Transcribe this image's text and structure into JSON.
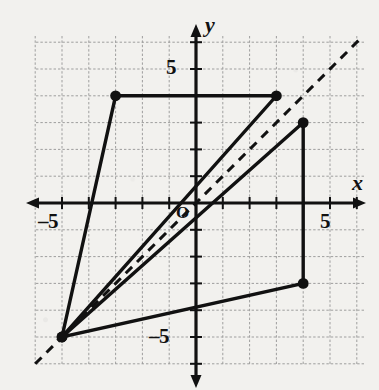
{
  "chart_data": {
    "type": "scatter",
    "title": "",
    "xlabel": "x",
    "ylabel": "y",
    "grid": true,
    "legend": "none",
    "xlim": [
      -6,
      6.3
    ],
    "ylim": [
      -6.1,
      6.2
    ],
    "xticks": [
      -5,
      5
    ],
    "yticks": [
      -5,
      5
    ],
    "xtick_labels": [
      "–5",
      "5"
    ],
    "ytick_labels": [
      "–5",
      "5"
    ],
    "origin_label": "O",
    "annotations": [
      {
        "text": "y",
        "role": "y-axis-label"
      },
      {
        "text": "x",
        "role": "x-axis-label"
      },
      {
        "text": "O",
        "role": "origin-label"
      }
    ],
    "series": [
      {
        "name": "preimage-triangle",
        "type": "closed-polygon",
        "style": "solid",
        "points": [
          [
            -3,
            4
          ],
          [
            3,
            4
          ],
          [
            -5,
            -5
          ]
        ],
        "vertices_marked": [
          [
            -3,
            4
          ],
          [
            3,
            4
          ],
          [
            -5,
            -5
          ]
        ]
      },
      {
        "name": "image-triangle",
        "type": "closed-polygon",
        "style": "solid",
        "points": [
          [
            4,
            3
          ],
          [
            4,
            -3
          ],
          [
            -5,
            -5
          ]
        ],
        "vertices_marked": [
          [
            4,
            3
          ],
          [
            4,
            -3
          ],
          [
            -5,
            -5
          ]
        ]
      },
      {
        "name": "line-of-reflection",
        "type": "line",
        "style": "dashed",
        "equation": "y = x",
        "points": [
          [
            -6,
            -6
          ],
          [
            6.1,
            6.1
          ]
        ]
      }
    ]
  },
  "geometry": {
    "origin_px": {
      "x": 196,
      "y": 203
    },
    "unit_px": 26.8,
    "grid_bounds_px": {
      "left": 36,
      "top": 36,
      "right": 366,
      "bottom": 366
    }
  },
  "labels": {
    "y_axis": "y",
    "x_axis": "x",
    "origin": "O",
    "y_five": "5",
    "y_neg_five": "–5",
    "x_five": "5",
    "x_neg_five": "–5"
  },
  "colors": {
    "background": "#f2f1ee",
    "grid": "#9a9a9a",
    "axis": "#111111",
    "stroke": "#111111",
    "point": "#111111"
  }
}
